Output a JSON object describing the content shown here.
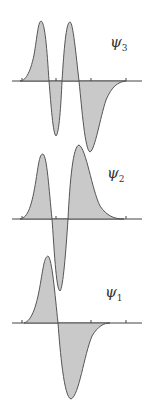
{
  "figure": {
    "panels": [
      {
        "id": "psi3",
        "label_symbol": "ψ",
        "label_subscript": "3",
        "label_pos": [
          110,
          33
        ],
        "baseline_y": 81,
        "axis": [
          12,
          142
        ],
        "ticks": [
          22,
          56,
          91,
          126
        ],
        "path": "M 20 81 C 25 81, 30 74, 34 55 C 37 38, 38 22, 41 21 C 45 22, 47 50, 49 81 C 51 105, 53 134, 56 136 C 59 134, 61 105, 62 81 C 64 50, 66 22, 70 22 C 73 22, 76 55, 79 81 C 82 110, 85 150, 90 152 C 95 150, 100 118, 106 100 C 112 86, 118 82, 126 81 Z"
      },
      {
        "id": "psi2",
        "label_symbol": "ψ",
        "label_subscript": "2",
        "label_pos": [
          107,
          164
        ],
        "baseline_y": 219,
        "axis": [
          12,
          142
        ],
        "ticks": [
          22,
          56,
          91,
          126
        ],
        "path": "M 20 219 C 28 218, 32 205, 36 180 C 39 160, 40 154, 43 154 C 47 156, 49 190, 52 219 C 54 245, 56 290, 60 291 C 63 289, 66 250, 68 219 C 70 180, 73 146, 79 145 C 86 148, 92 190, 100 206 C 107 216, 114 219, 124 219 Z"
      },
      {
        "id": "psi1",
        "label_symbol": "ψ",
        "label_subscript": "1",
        "label_pos": [
          105,
          283
        ],
        "baseline_y": 323,
        "axis": [
          12,
          142
        ],
        "ticks": [
          22,
          56,
          91,
          126
        ],
        "path": "M 24 323 C 32 321, 37 305, 41 280 C 44 262, 45 257, 48 256 C 52 258, 55 295, 58 323 C 60 350, 64 398, 71 399 C 79 396, 84 355, 92 336 C 98 326, 104 323, 110 323 Z"
      }
    ],
    "colors": {
      "fill": "#c9c9c9",
      "stroke": "#555555",
      "axis": "#444444",
      "text": "#333333",
      "background": "#ffffff"
    }
  }
}
